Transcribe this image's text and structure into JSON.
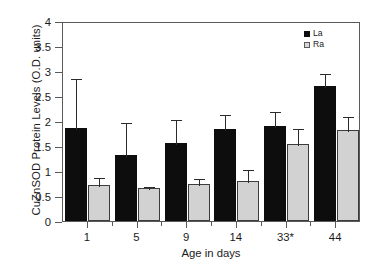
{
  "chart_data": {
    "type": "bar",
    "title": "",
    "xlabel": "Age in days",
    "ylabel": "CuZnSOD Protein Levels (O.D. units)",
    "categories": [
      "1",
      "5",
      "9",
      "14",
      "33*",
      "44"
    ],
    "ylim": [
      0,
      4
    ],
    "yticks": [
      "0",
      "0.5",
      "1",
      "1.5",
      "2",
      "2.5",
      "3",
      "3.5",
      "4"
    ],
    "ytick_values": [
      0,
      0.5,
      1,
      1.5,
      2,
      2.5,
      3,
      3.5,
      4
    ],
    "grid": false,
    "legend_position": "top-right-inside",
    "series": [
      {
        "name": "La",
        "color": "#0d0d0d",
        "values": [
          1.87,
          1.33,
          1.57,
          1.85,
          1.9,
          2.7
        ],
        "errors_upper": [
          1.02,
          0.67,
          0.5,
          0.32,
          0.32,
          0.28
        ]
      },
      {
        "name": "Ra",
        "color": "#d2d2d2",
        "values": [
          0.72,
          0.67,
          0.75,
          0.8,
          1.55,
          1.83
        ],
        "errors_upper": [
          0.18,
          0.06,
          0.14,
          0.27,
          0.33,
          0.3
        ]
      }
    ]
  },
  "legend": {
    "items": [
      {
        "label": "La",
        "swatch": "black-square"
      },
      {
        "label": "Ra",
        "swatch": "gray-square"
      }
    ]
  },
  "axis": {
    "y_title": "CuZnSOD Protein Levels (O.D. units)",
    "x_title": "Age in days"
  }
}
